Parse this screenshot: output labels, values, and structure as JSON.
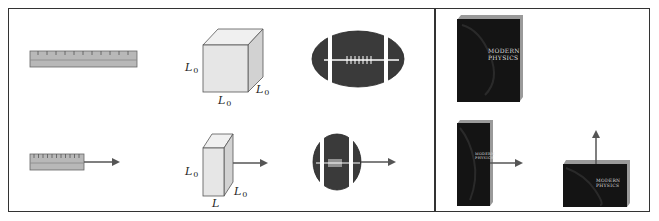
{
  "diagram": {
    "left_panel": {
      "description": "Length contraction: objects at rest (top) vs moving (bottom)",
      "rest_row": {
        "ruler": {
          "label": ""
        },
        "cube": {
          "height_label": "L",
          "height_sub": "0",
          "width_label": "L",
          "width_sub": "0",
          "depth_label": "L",
          "depth_sub": "0"
        },
        "football": {
          "shape": "elongated"
        }
      },
      "moving_row": {
        "ruler": {
          "label": "",
          "arrow": "right"
        },
        "cube": {
          "height_label": "L",
          "height_sub": "0",
          "width_label": "L",
          "width_sub": "",
          "depth_label": "L",
          "depth_sub": "0",
          "arrow": "right"
        },
        "football": {
          "shape": "contracted",
          "arrow": "right"
        }
      }
    },
    "right_panel": {
      "book_rest": {
        "title_line1": "MODERN",
        "title_line2": "PHYSICS"
      },
      "book_moving_horizontal": {
        "title_line1": "MODERN",
        "title_line2": "PHYSICS",
        "arrow": "right"
      },
      "book_moving_vertical": {
        "title_line1": "MODERN",
        "title_line2": "PHYSICS",
        "arrow": "up"
      }
    },
    "colors": {
      "frame": "#333333",
      "ruler_fill": "#b8b8b8",
      "cube_face": "#e6e6e6",
      "cube_side": "#d2d2d2",
      "football": "#3a3a3a",
      "book": "#141414",
      "book_edge": "#9a9a9a",
      "arrow": "#555555"
    }
  }
}
